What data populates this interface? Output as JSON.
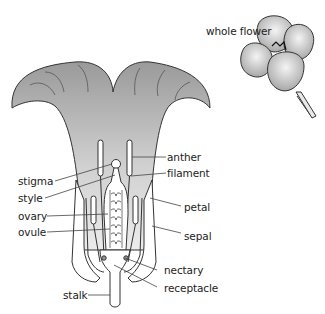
{
  "diagram": {
    "inset_label": "whole flower",
    "labels": {
      "anther": "anther",
      "filament": "filament",
      "stigma": "stigma",
      "style": "style",
      "ovary": "ovary",
      "ovule": "ovule",
      "petal": "petal",
      "sepal": "sepal",
      "nectary": "nectary",
      "receptacle": "receptacle",
      "stalk": "stalk"
    },
    "colors": {
      "petal_fill": "#b8b8b8",
      "petal_light": "#e6e6e6",
      "outline": "#333333",
      "leader_line": "#444444"
    }
  }
}
